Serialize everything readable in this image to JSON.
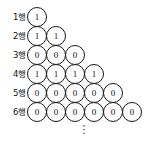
{
  "figure": {
    "rows": [
      {
        "label": "1행",
        "values": [
          "1"
        ]
      },
      {
        "label": "2행",
        "values": [
          "1",
          "1"
        ]
      },
      {
        "label": "3행",
        "values": [
          "0",
          "0",
          "0"
        ]
      },
      {
        "label": "4행",
        "values": [
          "1",
          "1",
          "1",
          "1"
        ]
      },
      {
        "label": "5행",
        "values": [
          "0",
          "0",
          "0",
          "0",
          "0"
        ]
      },
      {
        "label": "6행",
        "values": [
          "0",
          "0",
          "0",
          "0",
          "0",
          "0"
        ]
      }
    ],
    "continuation": "⋮",
    "colors": {
      "background": "#ffffff",
      "circle_stroke": "#1a1a1a",
      "circle_fill": "#ffffff",
      "text": "#111111"
    }
  }
}
